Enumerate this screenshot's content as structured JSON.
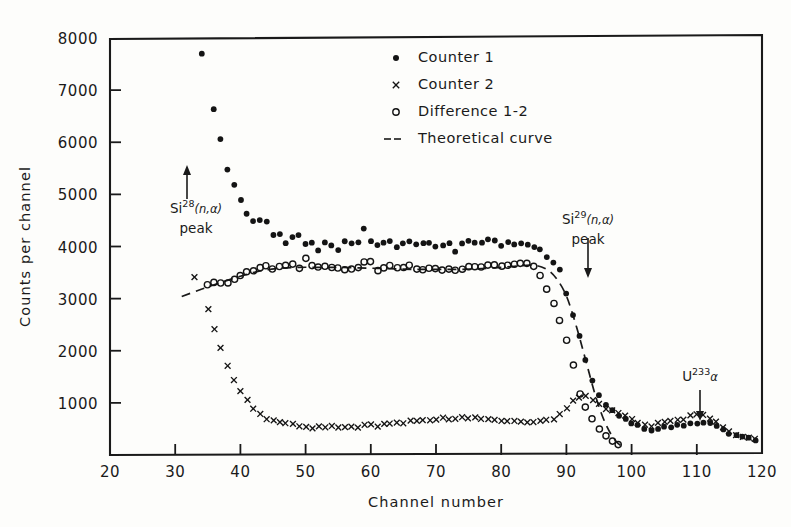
{
  "chart_data": {
    "type": "scatter",
    "title": "",
    "xlabel": "Channel number",
    "ylabel": "Counts per channel",
    "xlim": [
      20,
      120
    ],
    "ylim": [
      0,
      8000
    ],
    "xticks": [
      20,
      30,
      40,
      50,
      60,
      70,
      80,
      90,
      100,
      110,
      120
    ],
    "yticks": [
      1000,
      2000,
      3000,
      4000,
      5000,
      6000,
      7000,
      8000
    ],
    "grid": false,
    "legend_position": "upper-center",
    "legend": [
      {
        "label": "Counter 1",
        "marker": "filled-dot"
      },
      {
        "label": "Counter 2",
        "marker": "cross"
      },
      {
        "label": "Difference 1-2",
        "marker": "open-circle"
      },
      {
        "label": "Theoretical curve",
        "marker": "dashed-line"
      }
    ],
    "annotations": [
      {
        "id": "si28-peak",
        "base": "Si",
        "sup": "28",
        "rest": "(n,α)",
        "line2": "peak",
        "arrow": "up",
        "channel": 32
      },
      {
        "id": "si29-peak",
        "base": "Si",
        "sup": "29",
        "rest": "(n,α)",
        "line2": "peak",
        "arrow": "down",
        "channel": 93
      },
      {
        "id": "u233-alpha",
        "base": "U",
        "sup": "233",
        "rest": "α",
        "line2": "",
        "arrow": "down",
        "channel": 110
      }
    ],
    "series": [
      {
        "name": "Counter 1",
        "marker": "filled-dot",
        "x": [
          34,
          36,
          37,
          38,
          39,
          40,
          41,
          42,
          43,
          44,
          45,
          46,
          47,
          48,
          49,
          50,
          51,
          52,
          53,
          54,
          55,
          56,
          57,
          58,
          59,
          60,
          61,
          62,
          63,
          64,
          65,
          66,
          67,
          68,
          69,
          70,
          71,
          72,
          73,
          74,
          75,
          76,
          77,
          78,
          79,
          80,
          81,
          82,
          83,
          84,
          85,
          86,
          87,
          88,
          89,
          90,
          91,
          92,
          93,
          94,
          95,
          96,
          97,
          98,
          99,
          100,
          101,
          102,
          103,
          104,
          105,
          106,
          107,
          108,
          109,
          110,
          111,
          112,
          113,
          114,
          115,
          116,
          117,
          118,
          119
        ],
        "y": [
          7700,
          6650,
          6050,
          5480,
          5180,
          4880,
          4620,
          4500,
          4490,
          4500,
          4200,
          4220,
          4080,
          4160,
          4220,
          4060,
          4060,
          3930,
          4080,
          4000,
          3950,
          4090,
          4050,
          4080,
          4340,
          4090,
          4010,
          4060,
          4090,
          4000,
          4070,
          4090,
          4050,
          4050,
          4090,
          4000,
          4000,
          4050,
          3900,
          4060,
          4090,
          4090,
          4070,
          4120,
          4130,
          4000,
          4090,
          4060,
          4080,
          4050,
          4010,
          3950,
          3800,
          3700,
          3550,
          3100,
          2680,
          2300,
          1840,
          1420,
          1130,
          980,
          850,
          760,
          700,
          620,
          560,
          520,
          480,
          500,
          530,
          540,
          560,
          580,
          600,
          620,
          640,
          600,
          560,
          500,
          420,
          380,
          340,
          320,
          300
        ]
      },
      {
        "name": "Counter 2",
        "marker": "cross",
        "x": [
          33,
          35,
          36,
          37,
          38,
          39,
          40,
          41,
          42,
          43,
          44,
          45,
          46,
          47,
          48,
          49,
          50,
          51,
          52,
          53,
          54,
          55,
          56,
          57,
          58,
          59,
          60,
          61,
          62,
          63,
          64,
          65,
          66,
          67,
          68,
          69,
          70,
          71,
          72,
          73,
          74,
          75,
          76,
          77,
          78,
          79,
          80,
          81,
          82,
          83,
          84,
          85,
          86,
          87,
          88,
          89,
          90,
          91,
          92,
          93,
          94,
          95,
          96,
          97,
          98,
          99,
          100,
          101,
          102,
          103,
          104,
          105,
          106,
          107,
          108,
          109,
          110,
          111,
          112,
          113,
          114,
          115,
          116,
          117,
          118,
          119
        ],
        "y": [
          3430,
          2820,
          2400,
          2050,
          1720,
          1420,
          1220,
          1060,
          900,
          800,
          700,
          660,
          640,
          600,
          580,
          560,
          540,
          520,
          560,
          540,
          560,
          520,
          540,
          560,
          540,
          560,
          580,
          560,
          580,
          600,
          620,
          600,
          640,
          660,
          680,
          660,
          680,
          700,
          680,
          700,
          720,
          700,
          720,
          700,
          680,
          660,
          640,
          660,
          640,
          620,
          640,
          620,
          640,
          660,
          700,
          780,
          900,
          1040,
          1120,
          1120,
          1040,
          960,
          900,
          860,
          820,
          760,
          700,
          620,
          580,
          560,
          600,
          620,
          640,
          660,
          700,
          740,
          780,
          760,
          700,
          620,
          520,
          440,
          380,
          340,
          320,
          300
        ]
      },
      {
        "name": "Difference 1-2",
        "marker": "open-circle",
        "x": [
          35,
          36,
          37,
          38,
          39,
          40,
          41,
          42,
          43,
          44,
          45,
          46,
          47,
          48,
          49,
          50,
          51,
          52,
          53,
          54,
          55,
          56,
          57,
          58,
          59,
          60,
          61,
          62,
          63,
          64,
          65,
          66,
          67,
          68,
          69,
          70,
          71,
          72,
          73,
          74,
          75,
          76,
          77,
          78,
          79,
          80,
          81,
          82,
          83,
          84,
          85,
          86,
          87,
          88,
          89,
          90,
          91,
          92,
          93,
          94,
          95,
          96,
          97,
          98
        ],
        "y": [
          3280,
          3290,
          3300,
          3320,
          3350,
          3420,
          3500,
          3550,
          3580,
          3620,
          3580,
          3620,
          3640,
          3660,
          3600,
          3780,
          3640,
          3600,
          3620,
          3580,
          3600,
          3560,
          3580,
          3600,
          3720,
          3700,
          3560,
          3580,
          3620,
          3600,
          3600,
          3620,
          3560,
          3540,
          3580,
          3560,
          3540,
          3560,
          3540,
          3560,
          3600,
          3600,
          3620,
          3640,
          3640,
          3620,
          3640,
          3660,
          3680,
          3660,
          3620,
          3440,
          3180,
          2900,
          2560,
          2180,
          1740,
          1180,
          940,
          700,
          500,
          380,
          260,
          180
        ]
      },
      {
        "name": "Theoretical curve",
        "marker": "dashed-line",
        "x": [
          31,
          34,
          37,
          40,
          43,
          46,
          49,
          52,
          55,
          58,
          61,
          64,
          67,
          70,
          73,
          76,
          79,
          82,
          85,
          87,
          88.5,
          90,
          91.5,
          93,
          94.5,
          96,
          97.5,
          99
        ],
        "y": [
          3040,
          3180,
          3310,
          3430,
          3530,
          3580,
          3600,
          3600,
          3600,
          3590,
          3580,
          3570,
          3560,
          3560,
          3560,
          3570,
          3590,
          3620,
          3640,
          3560,
          3380,
          3050,
          2480,
          1800,
          1120,
          600,
          280,
          120
        ]
      }
    ]
  },
  "figure": {
    "caption": ""
  }
}
